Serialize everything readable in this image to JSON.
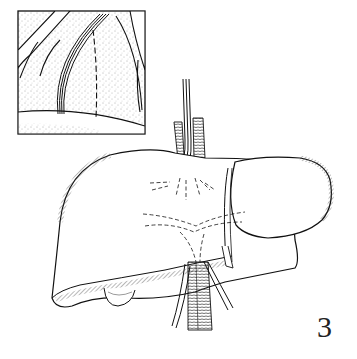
{
  "figure": {
    "number_label": "3",
    "colors": {
      "ink": "#1a1a1a",
      "background": "#ffffff"
    }
  }
}
